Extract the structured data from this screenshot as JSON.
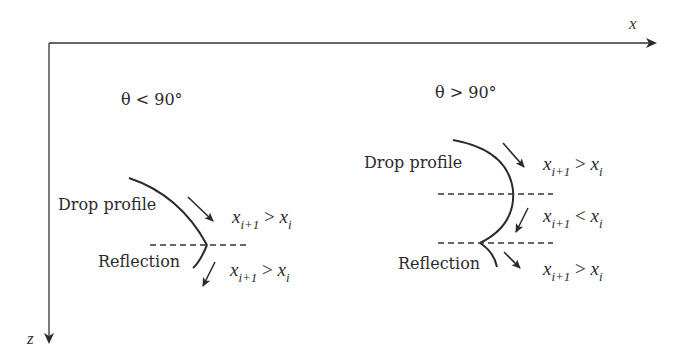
{
  "axes": {
    "x_label": "x",
    "z_label": "z"
  },
  "left_panel": {
    "condition": "θ < 90°",
    "profile_label": "Drop profile",
    "reflection_label": "Reflection",
    "upper_relation": {
      "lhs": "x",
      "lhs_sub": "i+1",
      "op": ">",
      "rhs": "x",
      "rhs_sub": "i"
    },
    "lower_relation": {
      "lhs": "x",
      "lhs_sub": "i+1",
      "op": ">",
      "rhs": "x",
      "rhs_sub": "i"
    }
  },
  "right_panel": {
    "condition": "θ > 90°",
    "profile_label": "Drop profile",
    "reflection_label": "Reflection",
    "upper_relation": {
      "lhs": "x",
      "lhs_sub": "i+1",
      "op": ">",
      "rhs": "x",
      "rhs_sub": "i"
    },
    "middle_relation": {
      "lhs": "x",
      "lhs_sub": "i+1",
      "op": "<",
      "rhs": "x",
      "rhs_sub": "i"
    },
    "lower_relation": {
      "lhs": "x",
      "lhs_sub": "i+1",
      "op": ">",
      "rhs": "x",
      "rhs_sub": "i"
    }
  },
  "colors": {
    "stroke": "#2b2b2b",
    "background": "#ffffff"
  }
}
